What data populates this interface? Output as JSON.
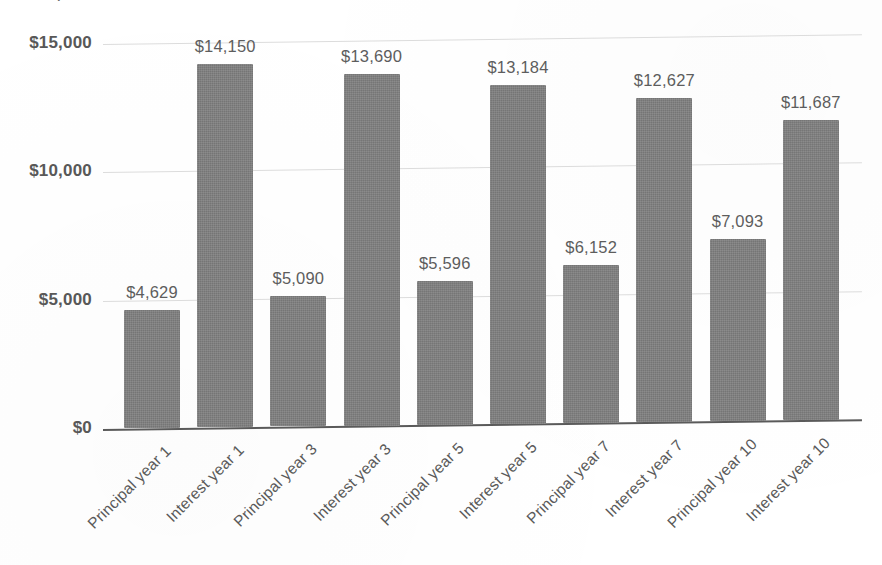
{
  "chart_data": {
    "type": "bar",
    "title": "",
    "title_remnant": "y",
    "xlabel": "",
    "ylabel": "",
    "categories": [
      "Principal year 1",
      "Interest year 1",
      "Principal year 3",
      "Interest year 3",
      "Principal year 5",
      "Interest year 5",
      "Principal year 7",
      "Interest year 7",
      "Principal year 10",
      "Interest year 10"
    ],
    "values": [
      4629,
      14150,
      5090,
      13690,
      5596,
      13184,
      6152,
      12627,
      7093,
      11687
    ],
    "value_labels": [
      "$4,629",
      "$14,150",
      "$5,090",
      "$13,690",
      "$5,596",
      "$13,184",
      "$6,152",
      "$12,627",
      "$7,093",
      "$11,687"
    ],
    "ylim": [
      0,
      15000
    ],
    "ytick_values": [
      0,
      5000,
      10000,
      15000
    ],
    "ytick_labels": [
      "$0",
      "$5,000",
      "$10,000",
      "$15,000"
    ],
    "grid": true,
    "legend": false,
    "bar_color": "#7e7e7e",
    "gridline_color": "#dcdcdc",
    "axis_color": "#5a5a5a",
    "text_color": "#5a5a5a",
    "background_color": "#ffffff"
  }
}
